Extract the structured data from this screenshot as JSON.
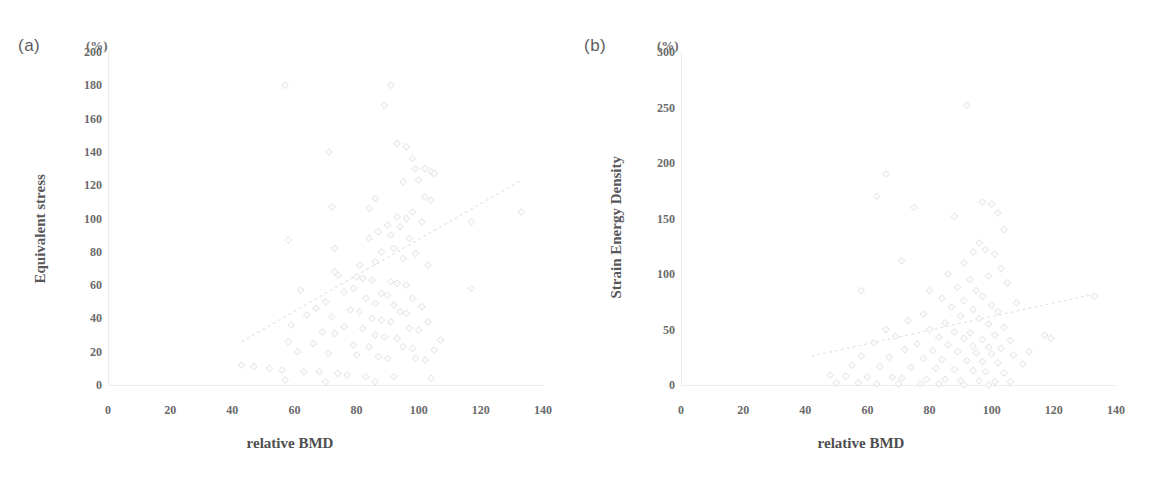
{
  "figure": {
    "unit_label": "(%)",
    "panels": [
      {
        "letter": "(a)",
        "ylabel": "Equivalent stress",
        "xlabel": "relative BMD",
        "yticks": [
          "0",
          "20",
          "40",
          "60",
          "80",
          "100",
          "120",
          "140",
          "160",
          "180",
          "200"
        ],
        "xticks": [
          "0",
          "20",
          "40",
          "60",
          "80",
          "100",
          "120",
          "140"
        ]
      },
      {
        "letter": "(b)",
        "ylabel": "Strain Energy Density",
        "xlabel": "relative BMD",
        "yticks": [
          "0",
          "50",
          "100",
          "150",
          "200",
          "250",
          "300"
        ],
        "xticks": [
          "0",
          "20",
          "40",
          "60",
          "80",
          "100",
          "120",
          "140"
        ]
      }
    ]
  },
  "chart_data": [
    {
      "type": "scatter",
      "title": "(a)",
      "xlabel": "relative BMD",
      "ylabel": "Equivalent stress",
      "xunit": "%",
      "yunit": "%",
      "xlim": [
        0,
        140
      ],
      "ylim": [
        0,
        200
      ],
      "xticks": [
        0,
        20,
        40,
        60,
        80,
        100,
        120,
        140
      ],
      "yticks": [
        0,
        20,
        40,
        60,
        80,
        100,
        120,
        140,
        160,
        180,
        200
      ],
      "grid": false,
      "legend": null,
      "marker": "open-diamond",
      "marker_color": "#fbfbfc",
      "marker_edge_color": "#dedee1",
      "trendline": {
        "style": "dotted",
        "color": "#e2e2e5",
        "x": [
          43,
          133
        ],
        "y": [
          26,
          123
        ]
      },
      "points": [
        [
          57,
          180
        ],
        [
          91,
          180
        ],
        [
          89,
          168
        ],
        [
          71,
          140
        ],
        [
          72,
          107
        ],
        [
          84,
          106
        ],
        [
          58,
          87
        ],
        [
          93,
          145
        ],
        [
          96,
          143
        ],
        [
          98,
          136
        ],
        [
          99,
          130
        ],
        [
          102,
          130
        ],
        [
          104,
          128
        ],
        [
          105,
          127
        ],
        [
          100,
          123
        ],
        [
          95,
          122
        ],
        [
          102,
          113
        ],
        [
          86,
          112
        ],
        [
          104,
          111
        ],
        [
          133,
          104
        ],
        [
          98,
          104
        ],
        [
          93,
          101
        ],
        [
          96,
          100
        ],
        [
          101,
          98
        ],
        [
          117,
          98
        ],
        [
          90,
          96
        ],
        [
          94,
          95
        ],
        [
          87,
          92
        ],
        [
          91,
          90
        ],
        [
          84,
          88
        ],
        [
          97,
          88
        ],
        [
          73,
          82
        ],
        [
          92,
          82
        ],
        [
          88,
          80
        ],
        [
          99,
          79
        ],
        [
          95,
          76
        ],
        [
          86,
          74
        ],
        [
          81,
          72
        ],
        [
          103,
          72
        ],
        [
          73,
          68
        ],
        [
          74,
          66
        ],
        [
          80,
          65
        ],
        [
          82,
          64
        ],
        [
          85,
          63
        ],
        [
          91,
          62
        ],
        [
          93,
          61
        ],
        [
          96,
          60
        ],
        [
          79,
          58
        ],
        [
          117,
          58
        ],
        [
          62,
          57
        ],
        [
          76,
          56
        ],
        [
          88,
          55
        ],
        [
          90,
          54
        ],
        [
          83,
          52
        ],
        [
          98,
          52
        ],
        [
          70,
          50
        ],
        [
          86,
          49
        ],
        [
          92,
          48
        ],
        [
          101,
          47
        ],
        [
          67,
          46
        ],
        [
          78,
          45
        ],
        [
          81,
          44
        ],
        [
          94,
          44
        ],
        [
          96,
          43
        ],
        [
          64,
          42
        ],
        [
          72,
          41
        ],
        [
          85,
          40
        ],
        [
          88,
          39
        ],
        [
          91,
          38
        ],
        [
          103,
          38
        ],
        [
          59,
          36
        ],
        [
          76,
          35
        ],
        [
          82,
          34
        ],
        [
          97,
          34
        ],
        [
          100,
          33
        ],
        [
          69,
          32
        ],
        [
          73,
          31
        ],
        [
          86,
          30
        ],
        [
          89,
          29
        ],
        [
          93,
          28
        ],
        [
          107,
          27
        ],
        [
          58,
          26
        ],
        [
          66,
          25
        ],
        [
          79,
          24
        ],
        [
          84,
          23
        ],
        [
          95,
          23
        ],
        [
          98,
          22
        ],
        [
          105,
          21
        ],
        [
          61,
          20
        ],
        [
          71,
          19
        ],
        [
          80,
          18
        ],
        [
          87,
          17
        ],
        [
          90,
          16
        ],
        [
          99,
          16
        ],
        [
          102,
          15
        ],
        [
          43,
          12
        ],
        [
          47,
          11
        ],
        [
          52,
          10
        ],
        [
          56,
          9
        ],
        [
          63,
          8
        ],
        [
          68,
          8
        ],
        [
          74,
          7
        ],
        [
          77,
          6
        ],
        [
          83,
          5
        ],
        [
          92,
          5
        ],
        [
          104,
          4
        ],
        [
          57,
          3
        ],
        [
          70,
          2
        ],
        [
          86,
          2
        ]
      ]
    },
    {
      "type": "scatter",
      "title": "(b)",
      "xlabel": "relative BMD",
      "ylabel": "Strain Energy Density",
      "xunit": "%",
      "yunit": "%",
      "xlim": [
        0,
        140
      ],
      "ylim": [
        0,
        300
      ],
      "xticks": [
        0,
        20,
        40,
        60,
        80,
        100,
        120,
        140
      ],
      "yticks": [
        0,
        50,
        100,
        150,
        200,
        250,
        300
      ],
      "grid": false,
      "legend": null,
      "marker": "open-diamond",
      "marker_color": "#fbfbfc",
      "marker_edge_color": "#dedee1",
      "trendline": {
        "style": "dotted",
        "color": "#e2e2e5",
        "x": [
          42,
          133
        ],
        "y": [
          26,
          82
        ]
      },
      "points": [
        [
          92,
          252
        ],
        [
          66,
          190
        ],
        [
          63,
          170
        ],
        [
          75,
          160
        ],
        [
          97,
          165
        ],
        [
          100,
          163
        ],
        [
          102,
          155
        ],
        [
          88,
          152
        ],
        [
          104,
          140
        ],
        [
          58,
          85
        ],
        [
          80,
          85
        ],
        [
          71,
          112
        ],
        [
          96,
          128
        ],
        [
          98,
          122
        ],
        [
          94,
          120
        ],
        [
          101,
          118
        ],
        [
          91,
          110
        ],
        [
          103,
          105
        ],
        [
          86,
          100
        ],
        [
          99,
          98
        ],
        [
          93,
          95
        ],
        [
          105,
          92
        ],
        [
          89,
          88
        ],
        [
          95,
          85
        ],
        [
          133,
          80
        ],
        [
          97,
          80
        ],
        [
          84,
          78
        ],
        [
          91,
          76
        ],
        [
          108,
          74
        ],
        [
          100,
          72
        ],
        [
          87,
          70
        ],
        [
          94,
          68
        ],
        [
          102,
          66
        ],
        [
          78,
          64
        ],
        [
          90,
          62
        ],
        [
          96,
          60
        ],
        [
          73,
          58
        ],
        [
          85,
          56
        ],
        [
          99,
          55
        ],
        [
          104,
          52
        ],
        [
          66,
          50
        ],
        [
          80,
          50
        ],
        [
          88,
          48
        ],
        [
          93,
          47
        ],
        [
          101,
          45
        ],
        [
          69,
          44
        ],
        [
          83,
          43
        ],
        [
          91,
          42
        ],
        [
          97,
          41
        ],
        [
          106,
          40
        ],
        [
          117,
          45
        ],
        [
          119,
          42
        ],
        [
          112,
          30
        ],
        [
          62,
          38
        ],
        [
          76,
          37
        ],
        [
          86,
          36
        ],
        [
          94,
          35
        ],
        [
          99,
          34
        ],
        [
          103,
          33
        ],
        [
          72,
          32
        ],
        [
          81,
          31
        ],
        [
          89,
          30
        ],
        [
          95,
          29
        ],
        [
          100,
          28
        ],
        [
          107,
          27
        ],
        [
          58,
          26
        ],
        [
          67,
          25
        ],
        [
          78,
          24
        ],
        [
          84,
          23
        ],
        [
          92,
          22
        ],
        [
          97,
          21
        ],
        [
          102,
          20
        ],
        [
          110,
          19
        ],
        [
          55,
          18
        ],
        [
          64,
          17
        ],
        [
          74,
          16
        ],
        [
          82,
          15
        ],
        [
          88,
          14
        ],
        [
          94,
          13
        ],
        [
          98,
          12
        ],
        [
          104,
          11
        ],
        [
          48,
          9
        ],
        [
          53,
          8
        ],
        [
          60,
          7
        ],
        [
          68,
          7
        ],
        [
          71,
          6
        ],
        [
          79,
          5
        ],
        [
          85,
          5
        ],
        [
          90,
          4
        ],
        [
          96,
          4
        ],
        [
          101,
          3
        ],
        [
          106,
          3
        ],
        [
          50,
          2
        ],
        [
          57,
          2
        ],
        [
          63,
          1
        ],
        [
          70,
          1
        ],
        [
          77,
          1
        ],
        [
          83,
          1
        ],
        [
          91,
          0
        ],
        [
          99,
          0
        ]
      ]
    }
  ]
}
